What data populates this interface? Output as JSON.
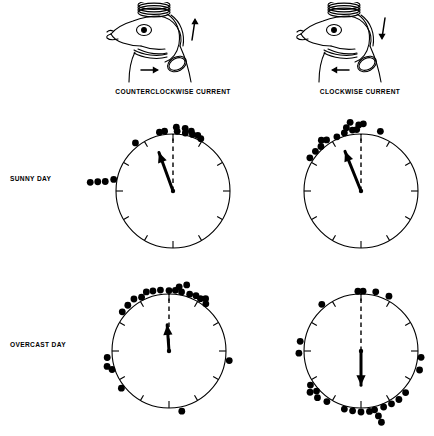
{
  "figure": {
    "type": "circular-orientation-diagram",
    "background": "#ffffff",
    "ink": "#000000"
  },
  "columns": [
    {
      "caption": "COUNTERCLOCKWISE CURRENT",
      "bird_icon": "bird-head-with-coil-icon"
    },
    {
      "caption": "CLOCKWISE CURRENT",
      "bird_icon": "bird-head-with-coil-icon"
    }
  ],
  "rows": [
    {
      "label": "SUNNY DAY"
    },
    {
      "label": "OVERCAST DAY"
    }
  ],
  "chart_data": {
    "type": "scatter",
    "subtype": "circular-histogram",
    "title": "",
    "xlabel": "",
    "ylabel": "",
    "angle_convention": "degrees clockwise from north (top = 0)",
    "tick_interval_deg": 30,
    "tick_count": 12,
    "reference_line": {
      "style": "dashed",
      "angle_deg": 0,
      "label": "north"
    },
    "panels": [
      {
        "id": "sunny-counterclockwise",
        "row": "SUNNY DAY",
        "column": "COUNTERCLOCKWISE CURRENT",
        "mean_vector": {
          "angle_deg": 340,
          "length": 0.72
        },
        "points": [
          {
            "angle_deg": 352,
            "r": 1.06
          },
          {
            "angle_deg": 347,
            "r": 1.06
          },
          {
            "angle_deg": 3,
            "r": 1.12
          },
          {
            "angle_deg": 4,
            "r": 1.05
          },
          {
            "angle_deg": 11,
            "r": 1.12
          },
          {
            "angle_deg": 12,
            "r": 1.04
          },
          {
            "angle_deg": 17,
            "r": 1.1
          },
          {
            "angle_deg": 19,
            "r": 1.05
          },
          {
            "angle_deg": 24,
            "r": 1.07
          },
          {
            "angle_deg": 28,
            "r": 1.04
          },
          {
            "angle_deg": 322,
            "r": 1.07
          },
          {
            "angle_deg": 281,
            "r": 1.06
          },
          {
            "angle_deg": 278,
            "r": 1.2
          },
          {
            "angle_deg": 277,
            "r": 1.33
          },
          {
            "angle_deg": 276,
            "r": 1.46
          }
        ]
      },
      {
        "id": "sunny-clockwise",
        "row": "SUNNY DAY",
        "column": "CLOCKWISE CURRENT",
        "mean_vector": {
          "angle_deg": 338,
          "length": 0.75
        },
        "points": [
          {
            "angle_deg": 358,
            "r": 1.16
          },
          {
            "angle_deg": 2,
            "r": 1.18
          },
          {
            "angle_deg": 352,
            "r": 1.08
          },
          {
            "angle_deg": 347,
            "r": 1.14
          },
          {
            "angle_deg": 344,
            "r": 1.06
          },
          {
            "angle_deg": 351,
            "r": 1.22
          },
          {
            "angle_deg": 356,
            "r": 1.08
          },
          {
            "angle_deg": 336,
            "r": 1.04
          },
          {
            "angle_deg": 326,
            "r": 1.08
          },
          {
            "angle_deg": 322,
            "r": 1.13
          },
          {
            "angle_deg": 318,
            "r": 1.05
          },
          {
            "angle_deg": 311,
            "r": 1.06
          },
          {
            "angle_deg": 303,
            "r": 1.07
          },
          {
            "angle_deg": 18,
            "r": 1.1
          }
        ]
      },
      {
        "id": "overcast-counterclockwise",
        "row": "OVERCAST DAY",
        "column": "COUNTERCLOCKWISE CURRENT",
        "mean_vector": {
          "angle_deg": 356,
          "length": 0.46
        },
        "points": [
          {
            "angle_deg": 0,
            "r": 1.06
          },
          {
            "angle_deg": 6,
            "r": 1.07
          },
          {
            "angle_deg": 9,
            "r": 1.14
          },
          {
            "angle_deg": 12,
            "r": 1.06
          },
          {
            "angle_deg": 15,
            "r": 1.2
          },
          {
            "angle_deg": 20,
            "r": 1.06
          },
          {
            "angle_deg": 26,
            "r": 1.08
          },
          {
            "angle_deg": 31,
            "r": 1.07
          },
          {
            "angle_deg": 35,
            "r": 1.12
          },
          {
            "angle_deg": 38,
            "r": 1.05
          },
          {
            "angle_deg": 352,
            "r": 1.08
          },
          {
            "angle_deg": 345,
            "r": 1.09
          },
          {
            "angle_deg": 339,
            "r": 1.11
          },
          {
            "angle_deg": 333,
            "r": 1.06
          },
          {
            "angle_deg": 326,
            "r": 1.1
          },
          {
            "angle_deg": 318,
            "r": 1.08
          },
          {
            "angle_deg": 310,
            "r": 1.07
          },
          {
            "angle_deg": 264,
            "r": 1.09
          },
          {
            "angle_deg": 256,
            "r": 1.12
          },
          {
            "angle_deg": 252,
            "r": 1.05
          },
          {
            "angle_deg": 232,
            "r": 1.06
          },
          {
            "angle_deg": 168,
            "r": 1.08
          },
          {
            "angle_deg": 99,
            "r": 1.07
          }
        ]
      },
      {
        "id": "overcast-clockwise",
        "row": "OVERCAST DAY",
        "column": "CLOCKWISE CURRENT",
        "mean_vector": {
          "angle_deg": 180,
          "length": 0.6
        },
        "points": [
          {
            "angle_deg": 357,
            "r": 1.05
          },
          {
            "angle_deg": 2,
            "r": 1.05
          },
          {
            "angle_deg": 14,
            "r": 1.07
          },
          {
            "angle_deg": 27,
            "r": 1.08
          },
          {
            "angle_deg": 320,
            "r": 1.07
          },
          {
            "angle_deg": 279,
            "r": 1.08
          },
          {
            "angle_deg": 268,
            "r": 1.09
          },
          {
            "angle_deg": 236,
            "r": 1.07
          },
          {
            "angle_deg": 231,
            "r": 1.15
          },
          {
            "angle_deg": 228,
            "r": 1.05
          },
          {
            "angle_deg": 223,
            "r": 1.12
          },
          {
            "angle_deg": 214,
            "r": 1.07
          },
          {
            "angle_deg": 196,
            "r": 1.06
          },
          {
            "angle_deg": 188,
            "r": 1.06
          },
          {
            "angle_deg": 180,
            "r": 1.07
          },
          {
            "angle_deg": 172,
            "r": 1.07
          },
          {
            "angle_deg": 167,
            "r": 1.06
          },
          {
            "angle_deg": 165,
            "r": 1.18
          },
          {
            "angle_deg": 164,
            "r": 1.3
          },
          {
            "angle_deg": 158,
            "r": 1.06
          },
          {
            "angle_deg": 150,
            "r": 1.07
          },
          {
            "angle_deg": 142,
            "r": 1.08
          },
          {
            "angle_deg": 133,
            "r": 1.07
          },
          {
            "angle_deg": 108,
            "r": 1.08
          },
          {
            "angle_deg": 96,
            "r": 1.06
          }
        ]
      }
    ]
  }
}
